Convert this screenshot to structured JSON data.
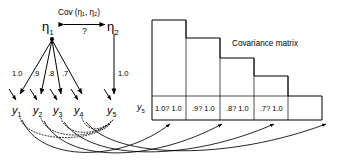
{
  "figure": {
    "type": "sem-path-diagram",
    "background": "#ffffff",
    "stroke": "#000000"
  },
  "latent": {
    "eta1": "η",
    "eta1_sub": "1",
    "eta2": "η",
    "eta2_sub": "2",
    "covariance_label": "Cov (η₁, η₂)",
    "covariance_value": "?"
  },
  "loadings": {
    "eta1_to_y": [
      "1.0",
      ".9",
      ".8",
      ".7"
    ],
    "eta2_to_y5": "1.0"
  },
  "observed": {
    "items": [
      {
        "name": "y",
        "sub": "1"
      },
      {
        "name": "y",
        "sub": "2"
      },
      {
        "name": "y",
        "sub": "3"
      },
      {
        "name": "y",
        "sub": "4"
      },
      {
        "name": "y",
        "sub": "5"
      }
    ]
  },
  "matrix": {
    "title": "Covariance matrix",
    "row_label": "y",
    "row_label_sub": "5",
    "cells": [
      "1.0? 1.0",
      ".9? 1.0",
      ".8? 1.0",
      ".7? 1.0",
      ""
    ],
    "columns": 5
  }
}
